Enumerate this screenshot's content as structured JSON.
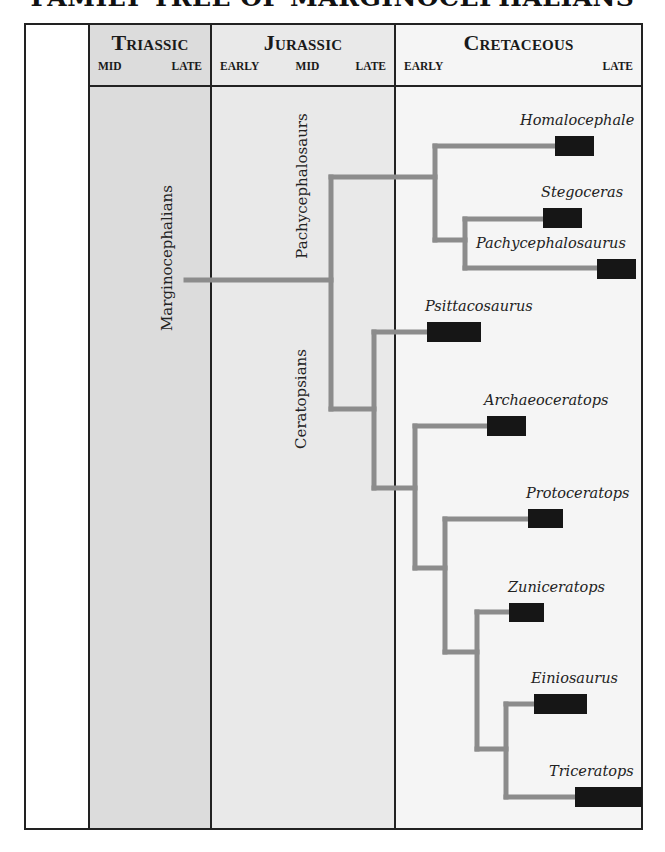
{
  "title": "FAMILY TREE OF MARGINOCEPHALIANS",
  "periods": [
    {
      "name": "Triassic",
      "epochs": [
        "MID",
        "LATE"
      ],
      "color": "#dcdcdc"
    },
    {
      "name": "Jurassic",
      "epochs": [
        "EARLY",
        "MID",
        "LATE"
      ],
      "color": "#e9e9e9"
    },
    {
      "name": "Cretaceous",
      "epochs": [
        "EARLY",
        "LATE"
      ],
      "color": "#f5f5f5"
    }
  ],
  "clades": {
    "root": "Marginocephalians",
    "pachy": "Pachycephalosaurs",
    "cera": "Ceratopsians"
  },
  "taxa": [
    {
      "name": "Homalocephale",
      "group": "Pachycephalosaurs"
    },
    {
      "name": "Stegoceras",
      "group": "Pachycephalosaurs"
    },
    {
      "name": "Pachycephalosaurus",
      "group": "Pachycephalosaurs"
    },
    {
      "name": "Psittacosaurus",
      "group": "Ceratopsians"
    },
    {
      "name": "Archaeoceratops",
      "group": "Ceratopsians"
    },
    {
      "name": "Protoceratops",
      "group": "Ceratopsians"
    },
    {
      "name": "Zuniceratops",
      "group": "Ceratopsians"
    },
    {
      "name": "Einiosaurus",
      "group": "Ceratopsians"
    },
    {
      "name": "Triceratops",
      "group": "Ceratopsians"
    }
  ],
  "colors": {
    "branch": "#8c8c8c",
    "range_bar": "#161616",
    "border": "#222222"
  }
}
